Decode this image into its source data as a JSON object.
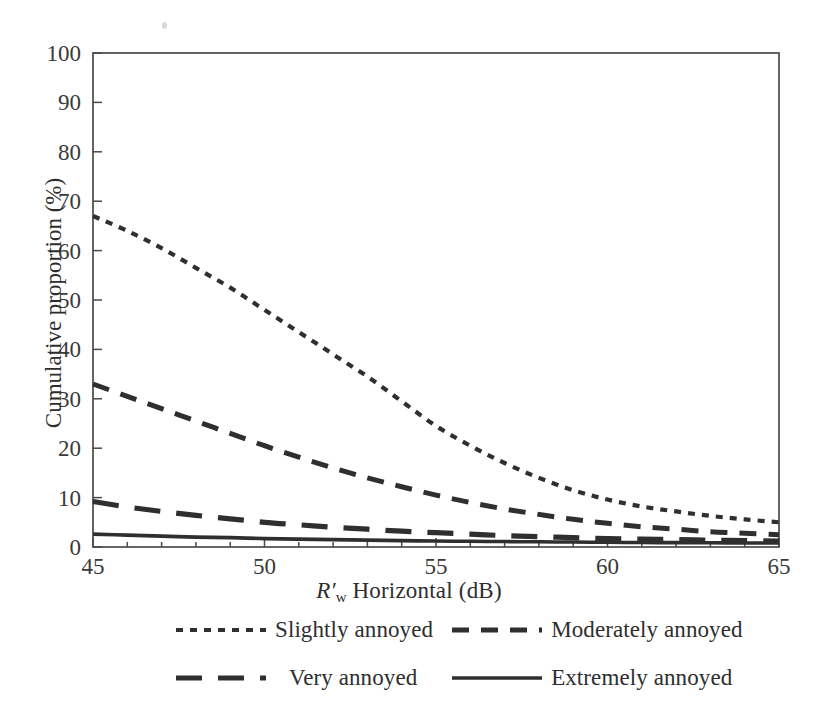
{
  "chart_data": {
    "type": "line",
    "title": "",
    "subtitle": "",
    "xlabel": "R'w Horizontal (dB)",
    "xlabel_parts": {
      "symbol": "R",
      "prime": "′",
      "subscript": "w",
      "rest": "Horizontal (dB)"
    },
    "ylabel": "Cumulative proportion (%)",
    "xlim": [
      45,
      65
    ],
    "ylim": [
      0,
      100
    ],
    "xticks": [
      45,
      50,
      55,
      60,
      65
    ],
    "xtick_labels": [
      "45",
      "50",
      "55",
      "60",
      "65"
    ],
    "xminor_interval": 1,
    "yticks": [
      0,
      10,
      20,
      30,
      40,
      50,
      60,
      70,
      80,
      90,
      100
    ],
    "ytick_labels": [
      "0",
      "10",
      "20",
      "30",
      "40",
      "50",
      "60",
      "70",
      "80",
      "90",
      "100"
    ],
    "grid": false,
    "legend_position": "below",
    "x": [
      45,
      46,
      47,
      48,
      49,
      50,
      51,
      52,
      53,
      54,
      55,
      56,
      57,
      58,
      59,
      60,
      61,
      62,
      63,
      64,
      65
    ],
    "series": [
      {
        "name": "Slightly annoyed",
        "dash": "dotted-short",
        "color": "#2f2f2f",
        "stroke_width": 4.2,
        "dasharray": "7,7",
        "values": [
          67.0,
          64.0,
          60.5,
          56.5,
          52.5,
          48.0,
          43.5,
          39.0,
          34.5,
          29.5,
          24.5,
          20.5,
          17.0,
          14.0,
          11.5,
          9.6,
          8.2,
          7.2,
          6.3,
          5.6,
          5.0
        ]
      },
      {
        "name": "Moderately annoyed",
        "dash": "medium-dash",
        "color": "#2f2f2f",
        "stroke_width": 5.0,
        "dasharray": "17,12",
        "values": [
          33.0,
          30.5,
          28.0,
          25.5,
          23.0,
          20.5,
          18.2,
          16.0,
          14.0,
          12.2,
          10.5,
          9.0,
          7.7,
          6.6,
          5.6,
          4.8,
          4.1,
          3.6,
          3.1,
          2.8,
          2.5
        ]
      },
      {
        "name": "Very annoyed",
        "dash": "long-dash",
        "color": "#2f2f2f",
        "stroke_width": 5.2,
        "dasharray": "26,16",
        "values": [
          9.2,
          8.1,
          7.2,
          6.4,
          5.7,
          5.0,
          4.5,
          4.0,
          3.6,
          3.2,
          2.9,
          2.6,
          2.3,
          2.1,
          1.9,
          1.7,
          1.6,
          1.5,
          1.4,
          1.3,
          1.2
        ]
      },
      {
        "name": "Extremely annoyed",
        "dash": "solid",
        "color": "#2f2f2f",
        "stroke_width": 3.6,
        "dasharray": "",
        "values": [
          2.6,
          2.4,
          2.2,
          2.0,
          1.9,
          1.7,
          1.6,
          1.5,
          1.4,
          1.3,
          1.2,
          1.15,
          1.1,
          1.05,
          1.0,
          0.95,
          0.9,
          0.88,
          0.85,
          0.82,
          0.8
        ]
      }
    ]
  },
  "axes": {
    "ylabel": "Cumulative proportion (%)",
    "xlabel_symbol": "R",
    "xlabel_prime": "′",
    "xlabel_subscript": "w",
    "xlabel_rest": "Horizontal (dB)"
  },
  "legend": {
    "items": [
      {
        "label": "Slightly annoyed",
        "style": "dotted-short"
      },
      {
        "label": "Moderately annoyed",
        "style": "medium-dash"
      },
      {
        "label": "Very annoyed",
        "style": "long-dash"
      },
      {
        "label": "Extremely annoyed",
        "style": "solid"
      }
    ]
  },
  "colors": {
    "curve": "#2f2f2f",
    "axis": "#4a4a4a",
    "text": "#2e2e2e",
    "background": "#ffffff"
  }
}
